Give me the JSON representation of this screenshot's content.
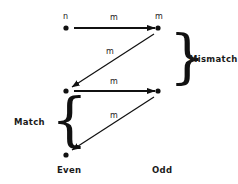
{
  "diagram": {
    "type": "state-transition-diagram",
    "background_color": "#ffffff",
    "ink_color": "#111111",
    "nodes": [
      {
        "id": "top-left",
        "label": "n",
        "column": "Even",
        "cx": 66,
        "cy": 28
      },
      {
        "id": "top-right",
        "label": "m",
        "column": "Odd",
        "cx": 158,
        "cy": 28
      },
      {
        "id": "middle-left",
        "label": "",
        "column": "Even",
        "cx": 66,
        "cy": 91
      },
      {
        "id": "middle-right",
        "label": "",
        "column": "Odd",
        "cx": 158,
        "cy": 91
      },
      {
        "id": "bottom-left",
        "label": "",
        "column": "Even",
        "cx": 66,
        "cy": 155
      }
    ],
    "edges": [
      {
        "id": "edge-1",
        "from": "top-left",
        "to": "top-right",
        "label": "m",
        "label_x": 110,
        "label_y": 15,
        "style": "thick-horizontal"
      },
      {
        "id": "edge-2",
        "from": "top-right",
        "to": "middle-left",
        "label": "m",
        "label_x": 106,
        "label_y": 52,
        "style": "thin-diagonal"
      },
      {
        "id": "edge-3",
        "from": "middle-left",
        "to": "middle-right",
        "label": "m",
        "label_x": 110,
        "label_y": 79,
        "style": "thick-horizontal"
      },
      {
        "id": "edge-4",
        "from": "middle-right",
        "to": "bottom-left",
        "label": "m",
        "label_x": 110,
        "label_y": 115,
        "style": "thin-diagonal"
      }
    ],
    "node_labels": [
      {
        "id": "node-label-n",
        "text": "n",
        "x": 63,
        "y": 13
      },
      {
        "id": "node-label-m",
        "text": "m",
        "x": 155,
        "y": 13
      }
    ],
    "braces": [
      {
        "id": "mismatch-brace",
        "text": "Mismatch",
        "direction": "right",
        "glyph": "}",
        "brace_x": 170,
        "brace_y": 36,
        "brace_height": 46,
        "label_x": 189,
        "label_y": 55
      },
      {
        "id": "match-brace",
        "text": "Match",
        "direction": "left",
        "glyph": "{",
        "brace_x": 52,
        "brace_y": 99,
        "brace_height": 46,
        "label_x": 14,
        "label_y": 118
      }
    ],
    "column_labels": [
      {
        "id": "column-label-even",
        "text": "Even",
        "x": 57,
        "y": 166
      },
      {
        "id": "column-label-odd",
        "text": "Odd",
        "x": 152,
        "y": 166
      }
    ]
  }
}
